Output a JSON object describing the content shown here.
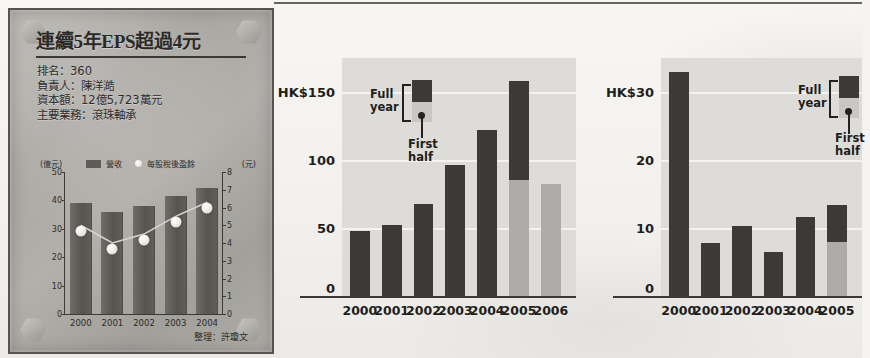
{
  "plaque": {
    "title": "連續5年EPS超過4元",
    "facts": [
      "排名：360",
      "負責人：陳洋澔",
      "資本額：12億5,723萬元",
      "主要業務：滾珠軸承"
    ],
    "credit": "整理：許瓊文"
  },
  "chart_data": [
    {
      "id": "company-revenue-eps",
      "type": "bar",
      "title": "連續5年EPS超過4元",
      "categories": [
        "2000",
        "2001",
        "2002",
        "2003",
        "2004"
      ],
      "series": [
        {
          "name": "營收",
          "type": "bar",
          "axis": "left",
          "values": [
            39,
            36,
            38,
            41.5,
            44.5
          ]
        },
        {
          "name": "每股稅後盈餘",
          "type": "line",
          "axis": "right",
          "values": [
            5.0,
            4.0,
            4.5,
            5.5,
            6.3
          ]
        }
      ],
      "left_unit": "(億元)",
      "right_unit": "(元)",
      "left_ticks": [
        "50",
        "40",
        "30",
        "20",
        "10",
        "0"
      ],
      "right_ticks": [
        "8",
        "7",
        "6",
        "5",
        "4",
        "3",
        "2",
        "1",
        "0"
      ],
      "ylim": [
        0,
        50
      ],
      "y2lim": [
        0,
        8
      ],
      "xlabel": "",
      "ylabel": "億元",
      "grid": false,
      "legend_position": "top",
      "colors": {
        "bar": "#56544f",
        "marker": "#ffffff"
      }
    },
    {
      "id": "hk-chart-150",
      "type": "bar",
      "title": "",
      "categories": [
        "2000",
        "2001",
        "2002",
        "2003",
        "2004",
        "2005",
        "2006"
      ],
      "series": [
        {
          "name": "Full year",
          "values": [
            48,
            52,
            68,
            96,
            122,
            158,
            null
          ]
        },
        {
          "name": "First half",
          "values": [
            null,
            null,
            null,
            null,
            null,
            85,
            82
          ]
        }
      ],
      "ytick_labels": [
        "HK$150",
        "100",
        "50",
        "0"
      ],
      "ytick_values": [
        150,
        100,
        50,
        0
      ],
      "ylim": [
        0,
        175
      ],
      "xlabel": "",
      "ylabel": "HK$",
      "grid": true,
      "legend": {
        "full_year": "Full\nyear",
        "first_half": "First\nhalf"
      },
      "legend_lines": {
        "full_year_l1": "Full",
        "full_year_l2": "year",
        "first_half_l1": "First",
        "first_half_l2": "half"
      },
      "colors": {
        "full_year": "#3b3a38",
        "first_half": "#aeaca8",
        "panel": "#dedcd8"
      }
    },
    {
      "id": "hk-chart-30",
      "type": "bar",
      "title": "",
      "categories": [
        "2000",
        "2001",
        "2002",
        "2003",
        "2004",
        "2005"
      ],
      "series": [
        {
          "name": "Full year",
          "values": [
            33,
            7.8,
            10.3,
            6.4,
            11.6,
            13.4
          ]
        },
        {
          "name": "First half",
          "values": [
            null,
            null,
            null,
            null,
            null,
            8.0
          ]
        }
      ],
      "ytick_labels": [
        "HK$30",
        "20",
        "10",
        "0"
      ],
      "ytick_values": [
        30,
        20,
        10,
        0
      ],
      "ylim": [
        0,
        35
      ],
      "xlabel": "",
      "ylabel": "HK$",
      "grid": true,
      "legend_lines": {
        "full_year_l1": "Full",
        "full_year_l2": "year",
        "first_half_l1": "First",
        "first_half_l2": "half"
      },
      "colors": {
        "full_year": "#3b3a38",
        "first_half": "#aeaca8",
        "panel": "#dedcd8"
      }
    }
  ]
}
